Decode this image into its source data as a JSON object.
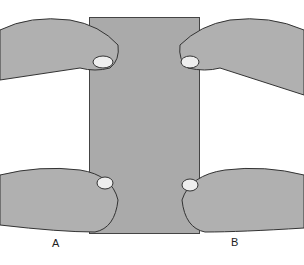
{
  "figure": {
    "labels": {
      "a": "A",
      "b": "B"
    },
    "colors": {
      "sheet": "#aaaaaa",
      "hand": "#b0b0b0",
      "outline": "#444444"
    }
  }
}
